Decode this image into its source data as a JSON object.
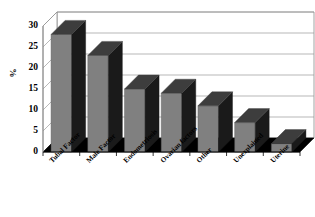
{
  "chart_data": {
    "type": "bar",
    "title": "",
    "subtitle": "",
    "xlabel": "",
    "ylabel": "%",
    "categories": [
      "Tubal Factor",
      "Male Factor",
      "Endometriosis",
      "Ovarian factors",
      "Other",
      "Unexplained",
      "Uterine"
    ],
    "values": [
      28,
      23,
      15,
      14,
      11,
      7,
      2
    ],
    "ylim": [
      0,
      30
    ],
    "yticks": [
      0,
      5,
      10,
      15,
      20,
      25,
      30
    ],
    "ytick_labels": [
      "0",
      "5",
      "10",
      "15",
      "20",
      "25",
      "30"
    ],
    "grid": true,
    "grid_axis": "y",
    "legend": false,
    "legend_position": "none",
    "style": "3d-column",
    "bar_color": "#808080",
    "bar_side_color": "#1a1a1a",
    "bar_top_color": "#3d3d3d",
    "floor_color": "#000000",
    "grid_color": "#9a9a9a",
    "axis_color": "#8a8a8a",
    "background_color": "#ffffff",
    "annotations": []
  }
}
